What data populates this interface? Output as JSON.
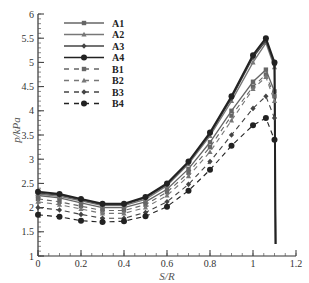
{
  "chart_data": {
    "type": "line",
    "title": "",
    "xlabel": "S/R",
    "ylabel": "p/kPa",
    "xlim": [
      0,
      1.2
    ],
    "ylim": [
      1,
      6
    ],
    "xticks": [
      "0",
      "0.2",
      "0.4",
      "0.6",
      "0.8",
      "1",
      "1.2"
    ],
    "yticks": [
      "1",
      "1.5",
      "2",
      "2.5",
      "3",
      "3.5",
      "4",
      "4.5",
      "5",
      "5.5",
      "6"
    ],
    "grid": false,
    "legend_position": "upper-left",
    "series": [
      {
        "name": "A1",
        "style": "solid",
        "marker": "square",
        "color": "#666666",
        "x": [
          0,
          0.1,
          0.2,
          0.3,
          0.4,
          0.5,
          0.6,
          0.7,
          0.8,
          0.9,
          1.0,
          1.06,
          1.1,
          1.105
        ],
        "y": [
          2.25,
          2.2,
          2.1,
          2.0,
          2.0,
          2.12,
          2.38,
          2.8,
          3.35,
          4.0,
          4.6,
          4.85,
          4.4,
          1.25
        ]
      },
      {
        "name": "A2",
        "style": "solid",
        "marker": "triangle",
        "color": "#777777",
        "x": [
          0,
          0.1,
          0.2,
          0.3,
          0.4,
          0.5,
          0.6,
          0.7,
          0.8,
          0.9,
          1.0,
          1.06,
          1.1,
          1.105
        ],
        "y": [
          2.28,
          2.23,
          2.14,
          2.04,
          2.04,
          2.17,
          2.45,
          2.9,
          3.48,
          4.2,
          5.0,
          5.4,
          4.9,
          1.25
        ]
      },
      {
        "name": "A3",
        "style": "solid",
        "marker": "diamond",
        "color": "#444444",
        "x": [
          0,
          0.1,
          0.2,
          0.3,
          0.4,
          0.5,
          0.6,
          0.7,
          0.8,
          0.9,
          1.0,
          1.06,
          1.1,
          1.105
        ],
        "y": [
          2.3,
          2.26,
          2.16,
          2.06,
          2.06,
          2.2,
          2.48,
          2.93,
          3.52,
          4.26,
          5.1,
          5.45,
          4.95,
          1.25
        ]
      },
      {
        "name": "A4",
        "style": "solid",
        "marker": "circle",
        "color": "#222222",
        "x": [
          0,
          0.1,
          0.2,
          0.3,
          0.4,
          0.5,
          0.6,
          0.7,
          0.8,
          0.9,
          1.0,
          1.06,
          1.1,
          1.105
        ],
        "y": [
          2.33,
          2.28,
          2.18,
          2.08,
          2.08,
          2.22,
          2.5,
          2.95,
          3.55,
          4.3,
          5.15,
          5.5,
          5.0,
          1.25
        ]
      },
      {
        "name": "B1",
        "style": "dashed",
        "marker": "square",
        "color": "#666666",
        "x": [
          0,
          0.1,
          0.2,
          0.3,
          0.4,
          0.5,
          0.6,
          0.7,
          0.8,
          0.9,
          1.0,
          1.06,
          1.1
        ],
        "y": [
          2.18,
          2.12,
          2.03,
          1.94,
          1.94,
          2.06,
          2.32,
          2.72,
          3.25,
          3.9,
          4.5,
          4.75,
          4.3
        ]
      },
      {
        "name": "B2",
        "style": "dashed",
        "marker": "triangle",
        "color": "#777777",
        "x": [
          0,
          0.1,
          0.2,
          0.3,
          0.4,
          0.5,
          0.6,
          0.7,
          0.8,
          0.9,
          1.0,
          1.06,
          1.1
        ],
        "y": [
          2.12,
          2.06,
          1.97,
          1.88,
          1.88,
          2.0,
          2.25,
          2.65,
          3.15,
          3.8,
          4.45,
          4.7,
          4.2
        ]
      },
      {
        "name": "B3",
        "style": "dashed",
        "marker": "diamond",
        "color": "#444444",
        "x": [
          0,
          0.1,
          0.2,
          0.3,
          0.4,
          0.5,
          0.6,
          0.7,
          0.8,
          0.9,
          1.0,
          1.06,
          1.1
        ],
        "y": [
          2.0,
          1.95,
          1.86,
          1.78,
          1.78,
          1.9,
          2.12,
          2.48,
          2.95,
          3.5,
          4.05,
          4.3,
          3.85
        ]
      },
      {
        "name": "B4",
        "style": "dashed",
        "marker": "circle",
        "color": "#222222",
        "x": [
          0,
          0.1,
          0.2,
          0.3,
          0.4,
          0.5,
          0.6,
          0.7,
          0.8,
          0.9,
          1.0,
          1.06,
          1.1
        ],
        "y": [
          1.85,
          1.81,
          1.73,
          1.7,
          1.72,
          1.82,
          2.02,
          2.35,
          2.78,
          3.28,
          3.7,
          3.85,
          3.4
        ]
      }
    ]
  }
}
